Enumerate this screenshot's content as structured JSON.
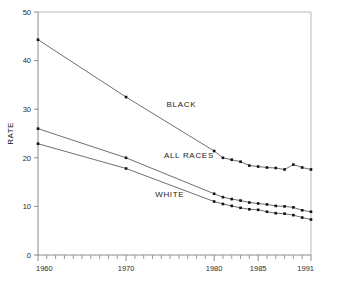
{
  "chart_data": {
    "type": "line",
    "title": "",
    "subtitle": "",
    "xlabel": "",
    "ylabel": "RATE",
    "xlim": [
      1960,
      1991
    ],
    "ylim": [
      0,
      50
    ],
    "grid": false,
    "legend_position": "inline-annotations",
    "y_ticks": [
      0,
      10,
      20,
      30,
      40,
      50
    ],
    "y_tick_labels": [
      "0",
      "10",
      "20",
      "30",
      "40",
      "50"
    ],
    "x_ticks": [
      1960,
      1970,
      1980,
      1985,
      1991
    ],
    "x_tick_labels": [
      "1960",
      "1970",
      "1980",
      "1985",
      "1991"
    ],
    "x_minor_tick_step": 1,
    "marker": "square",
    "series": [
      {
        "name": "BLACK",
        "label": "BLACK",
        "label_x": 1974.6,
        "label_y": 30.4,
        "color": "#4a4a4a",
        "x": [
          1960,
          1970,
          1980,
          1981,
          1982,
          1983,
          1984,
          1985,
          1986,
          1987,
          1988,
          1989,
          1990,
          1991
        ],
        "values": [
          44.3,
          32.5,
          21.4,
          20.0,
          19.6,
          19.2,
          18.4,
          18.2,
          18.0,
          17.9,
          17.6,
          18.6,
          18.0,
          17.6
        ]
      },
      {
        "name": "ALL RACES",
        "label": "ALL RACES",
        "label_x": 1974.3,
        "label_y": 19.9,
        "color": "#4a4a4a",
        "x": [
          1960,
          1970,
          1980,
          1981,
          1982,
          1983,
          1984,
          1985,
          1986,
          1987,
          1988,
          1989,
          1990,
          1991
        ],
        "values": [
          26.0,
          20.0,
          12.6,
          11.9,
          11.5,
          11.2,
          10.8,
          10.6,
          10.4,
          10.1,
          10.0,
          9.8,
          9.2,
          8.9
        ]
      },
      {
        "name": "WHITE",
        "label": "WHITE",
        "label_x": 1973.3,
        "label_y": 12.0,
        "color": "#4a4a4a",
        "x": [
          1960,
          1970,
          1980,
          1981,
          1982,
          1983,
          1984,
          1985,
          1986,
          1987,
          1988,
          1989,
          1990,
          1991
        ],
        "values": [
          22.9,
          17.8,
          11.0,
          10.5,
          10.1,
          9.7,
          9.4,
          9.3,
          8.9,
          8.6,
          8.5,
          8.2,
          7.7,
          7.3
        ]
      }
    ]
  },
  "footer": {
    "cropped_caption": ""
  }
}
